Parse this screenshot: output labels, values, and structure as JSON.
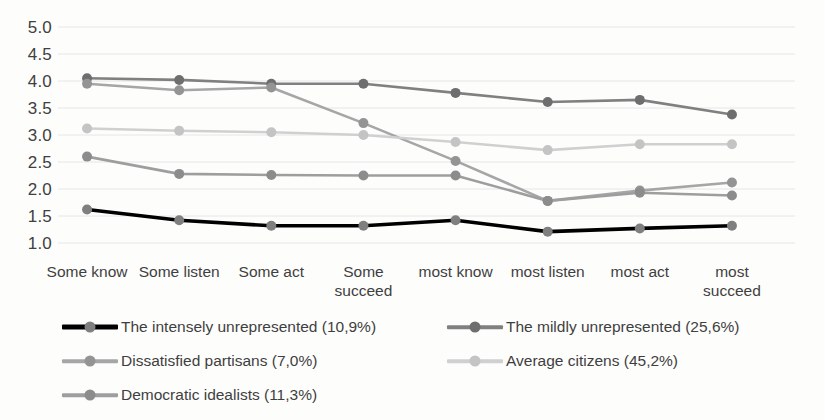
{
  "chart_data": {
    "type": "line",
    "title": "",
    "subtitle": "",
    "xlabel": "",
    "ylabel": "",
    "grid": true,
    "legend_position": "bottom",
    "ylim": [
      1.0,
      5.0
    ],
    "yticks": [
      "1.0",
      "1.5",
      "2.0",
      "2.5",
      "3.0",
      "3.5",
      "4.0",
      "4.5",
      "5.0"
    ],
    "ytick_values": [
      1.0,
      1.5,
      2.0,
      2.5,
      3.0,
      3.5,
      4.0,
      4.5,
      5.0
    ],
    "categories": [
      "Some know",
      "Some listen",
      "Some act",
      "Some succeed",
      "most know",
      "most listen",
      "most act",
      "most succeed"
    ],
    "series": [
      {
        "name": "The intensely unrepresented (10,9%)",
        "color": "#000000",
        "marker_color": "#7f7f7f",
        "values": [
          1.62,
          1.42,
          1.32,
          1.32,
          1.42,
          1.21,
          1.27,
          1.32
        ]
      },
      {
        "name": "The mildly unrepresented (25,6%)",
        "color": "#808080",
        "marker_color": "#6e6e6e",
        "values": [
          4.05,
          4.02,
          3.95,
          3.95,
          3.78,
          3.61,
          3.65,
          3.38
        ]
      },
      {
        "name": "Dissatisfied partisans (7,0%)",
        "color": "#a6a6a6",
        "marker_color": "#949494",
        "values": [
          3.95,
          3.83,
          3.88,
          3.22,
          2.52,
          1.78,
          1.97,
          2.12
        ]
      },
      {
        "name": "Average citizens (45,2%)",
        "color": "#d0d0d0",
        "marker_color": "#c4c4c4",
        "values": [
          3.12,
          3.08,
          3.05,
          3.0,
          2.87,
          2.72,
          2.83,
          2.83
        ]
      },
      {
        "name": "Democratic idealists (11,3%)",
        "color": "#9e9e9e",
        "marker_color": "#8c8c8c",
        "values": [
          2.6,
          2.28,
          2.26,
          2.25,
          2.25,
          1.78,
          1.93,
          1.88
        ]
      }
    ]
  },
  "legend": {
    "items": [
      {
        "label": "The intensely unrepresented (10,9%)",
        "color": "#000000",
        "marker_color": "#7f7f7f"
      },
      {
        "label": "The mildly unrepresented (25,6%)",
        "color": "#808080",
        "marker_color": "#6e6e6e"
      },
      {
        "label": "Dissatisfied partisans (7,0%)",
        "color": "#a6a6a6",
        "marker_color": "#949494"
      },
      {
        "label": "Average citizens (45,2%)",
        "color": "#d0d0d0",
        "marker_color": "#c4c4c4"
      },
      {
        "label": "Democratic idealists (11,3%)",
        "color": "#9e9e9e",
        "marker_color": "#8c8c8c"
      }
    ]
  },
  "style": {
    "grid_color": "#e6e6e6",
    "text_color": "#3f3f3f",
    "background": "#fdfdfc"
  }
}
